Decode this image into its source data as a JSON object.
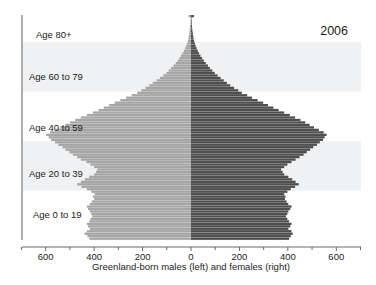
{
  "chart_data": {
    "type": "bar",
    "orientation": "horizontal-diverging",
    "title": "",
    "annotations": [
      {
        "name": "year",
        "text": "2006"
      },
      {
        "name": "age-band-80-plus",
        "text": "Age 80+"
      },
      {
        "name": "age-band-60-79",
        "text": "Age 60 to 79"
      },
      {
        "name": "age-band-40-59",
        "text": "Age 40 to 59"
      },
      {
        "name": "age-band-20-39",
        "text": "Age 20 to 39"
      },
      {
        "name": "age-band-0-19",
        "text": "Age 0 to 19"
      }
    ],
    "xlabel": "Greenland-born males (left) and females (right)",
    "ylabel": "",
    "xlim": [
      -700,
      700
    ],
    "xticks": [
      -600,
      -400,
      -200,
      0,
      200,
      400,
      600
    ],
    "xticklabels": [
      "600",
      "400",
      "200",
      "0",
      "200",
      "400",
      "600"
    ],
    "xminorticks": [
      -700,
      -500,
      -300,
      -100,
      100,
      300,
      500,
      700
    ],
    "grid": false,
    "legend": null,
    "colors": {
      "males": "#a6a6a6",
      "females": "#4f4f4f",
      "band": "#eff1f3",
      "axis": "#555555",
      "background": "#ffffff"
    },
    "series": [
      {
        "name": "Greenland-born males (left)",
        "side": "left",
        "color": "#a6a6a6"
      },
      {
        "name": "Greenland-born females (right)",
        "side": "right",
        "color": "#4f4f4f"
      }
    ],
    "ages": [
      0,
      1,
      2,
      3,
      4,
      5,
      6,
      7,
      8,
      9,
      10,
      11,
      12,
      13,
      14,
      15,
      16,
      17,
      18,
      19,
      20,
      21,
      22,
      23,
      24,
      25,
      26,
      27,
      28,
      29,
      30,
      31,
      32,
      33,
      34,
      35,
      36,
      37,
      38,
      39,
      40,
      41,
      42,
      43,
      44,
      45,
      46,
      47,
      48,
      49,
      50,
      51,
      52,
      53,
      54,
      55,
      56,
      57,
      58,
      59,
      60,
      61,
      62,
      63,
      64,
      65,
      66,
      67,
      68,
      69,
      70,
      71,
      72,
      73,
      74,
      75,
      76,
      77,
      78,
      79,
      80,
      81,
      82,
      83,
      84,
      85,
      86,
      87,
      88,
      89,
      90
    ],
    "males": [
      420,
      428,
      440,
      430,
      418,
      425,
      430,
      420,
      415,
      408,
      412,
      418,
      425,
      430,
      418,
      410,
      400,
      405,
      398,
      412,
      430,
      452,
      470,
      455,
      438,
      420,
      400,
      392,
      386,
      400,
      415,
      432,
      455,
      470,
      488,
      502,
      518,
      530,
      548,
      562,
      578,
      588,
      598,
      582,
      560,
      540,
      520,
      500,
      478,
      455,
      430,
      405,
      382,
      360,
      338,
      315,
      292,
      268,
      245,
      222,
      205,
      188,
      172,
      158,
      142,
      128,
      115,
      102,
      92,
      82,
      72,
      63,
      55,
      48,
      41,
      35,
      29,
      24,
      20,
      16,
      13,
      11,
      9,
      7,
      6,
      5,
      4,
      3,
      2,
      2,
      10
    ],
    "females": [
      405,
      412,
      420,
      415,
      402,
      410,
      415,
      405,
      398,
      392,
      398,
      402,
      410,
      415,
      402,
      395,
      388,
      390,
      385,
      398,
      412,
      430,
      445,
      432,
      418,
      402,
      385,
      378,
      372,
      385,
      398,
      415,
      432,
      448,
      465,
      478,
      492,
      505,
      520,
      532,
      545,
      552,
      560,
      548,
      528,
      508,
      490,
      472,
      452,
      430,
      408,
      385,
      362,
      340,
      318,
      298,
      275,
      252,
      232,
      210,
      195,
      178,
      162,
      148,
      135,
      122,
      110,
      98,
      88,
      78,
      70,
      61,
      53,
      46,
      39,
      33,
      28,
      23,
      19,
      16,
      13,
      11,
      9,
      8,
      6,
      5,
      4,
      3,
      3,
      2,
      12
    ]
  }
}
